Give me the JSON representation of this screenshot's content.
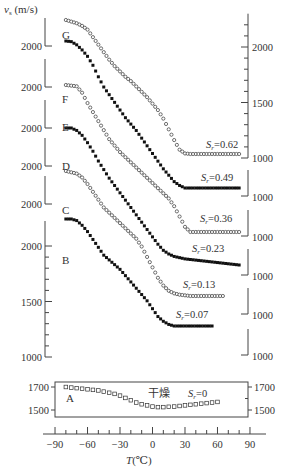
{
  "chart_data": {
    "type": "scatter",
    "title": "",
    "xlabel": "T (℃)",
    "ylabel": "v_s (m/s)",
    "x_ticks": [
      -90,
      -60,
      -30,
      0,
      30,
      60,
      90
    ],
    "xlim": [
      -90,
      90
    ],
    "dry_label": "干燥",
    "series": [
      {
        "name": "G",
        "sr": "Sr=0.62",
        "marker": "open-circle",
        "offset_2000_y": 45,
        "x": [
          -80,
          -75,
          -70,
          -65,
          -60,
          -55,
          -50,
          -45,
          -40,
          -35,
          -30,
          -25,
          -20,
          -15,
          -10,
          -5,
          0,
          5,
          10,
          15,
          20,
          25,
          30,
          35,
          40,
          45,
          50,
          55,
          60,
          65,
          70,
          75,
          80
        ],
        "y": [
          2280,
          2265,
          2250,
          2225,
          2190,
          2120,
          2050,
          1980,
          1910,
          1850,
          1800,
          1750,
          1710,
          1660,
          1610,
          1560,
          1500,
          1440,
          1360,
          1260,
          1160,
          1070,
          1035,
          1030,
          1030,
          1030,
          1030,
          1030,
          1030,
          1030,
          1030,
          1030,
          1030
        ]
      },
      {
        "name": "F",
        "sr": "Sr=0.49",
        "marker": "filled-square",
        "offset_2000_y": 118,
        "x": [
          -80,
          -75,
          -70,
          -65,
          -60,
          -55,
          -50,
          -45,
          -40,
          -35,
          -30,
          -25,
          -20,
          -15,
          -10,
          -5,
          0,
          5,
          10,
          15,
          20,
          25,
          30,
          35,
          40,
          45,
          50,
          55,
          60,
          65,
          70,
          75,
          80
        ],
        "y": [
          2180,
          2175,
          2150,
          2110,
          2060,
          1990,
          1900,
          1820,
          1760,
          1700,
          1640,
          1580,
          1530,
          1480,
          1420,
          1360,
          1300,
          1240,
          1180,
          1130,
          1080,
          1050,
          1030,
          1030,
          1030,
          1030,
          1030,
          1030,
          1030,
          1030,
          1030,
          1030,
          1030
        ]
      },
      {
        "name": "E",
        "sr": "Sr=0.36",
        "marker": "open-circle",
        "offset_2000_y": 185,
        "x": [
          -80,
          -75,
          -70,
          -65,
          -60,
          -55,
          -50,
          -45,
          -40,
          -35,
          -30,
          -25,
          -20,
          -15,
          -10,
          -5,
          0,
          5,
          10,
          15,
          20,
          25,
          30,
          35,
          40,
          45,
          50,
          55,
          60,
          65,
          70,
          75,
          80
        ],
        "y": [
          2160,
          2155,
          2150,
          2100,
          2020,
          1950,
          1880,
          1810,
          1740,
          1690,
          1640,
          1600,
          1560,
          1520,
          1480,
          1440,
          1400,
          1360,
          1320,
          1280,
          1220,
          1140,
          1060,
          1020,
          1020,
          1020,
          1020,
          1020,
          1020,
          1020,
          1020,
          1020,
          1020
        ]
      },
      {
        "name": "D",
        "sr": "Sr=0.23",
        "marker": "filled-square",
        "offset_2000_y": 250,
        "x": [
          -80,
          -75,
          -70,
          -65,
          -60,
          -55,
          -50,
          -45,
          -40,
          -35,
          -30,
          -25,
          -20,
          -15,
          -10,
          -5,
          0,
          5,
          10,
          15,
          20,
          25,
          30,
          35,
          40,
          45,
          50,
          55,
          60,
          65,
          70,
          75,
          80
        ],
        "y": [
          2170,
          2170,
          2150,
          2110,
          2050,
          1980,
          1900,
          1830,
          1760,
          1700,
          1640,
          1580,
          1520,
          1460,
          1400,
          1340,
          1280,
          1220,
          1170,
          1140,
          1120,
          1110,
          1100,
          1095,
          1090,
          1085,
          1080,
          1075,
          1070,
          1065,
          1060,
          1055,
          1050
        ]
      },
      {
        "name": "C",
        "sr": "Sr=0.13",
        "marker": "open-circle",
        "offset_2000_y": 210,
        "x": [
          -80,
          -75,
          -70,
          -65,
          -60,
          -55,
          -50,
          -45,
          -40,
          -35,
          -30,
          -25,
          -20,
          -15,
          -10,
          -5,
          0,
          5,
          10,
          15,
          20,
          25,
          30,
          35,
          40,
          45,
          50,
          55,
          60,
          65
        ],
        "y": [
          2080,
          2070,
          2060,
          2030,
          1980,
          1920,
          1860,
          1800,
          1760,
          1720,
          1680,
          1640,
          1600,
          1560,
          1500,
          1420,
          1340,
          1260,
          1200,
          1160,
          1140,
          1130,
          1125,
          1120,
          1120,
          1120,
          1120,
          1120,
          1120,
          1120
        ]
      },
      {
        "name": "B",
        "sr": "Sr=0.07",
        "marker": "filled-square",
        "offset_2000_y": 246,
        "x": [
          -80,
          -75,
          -70,
          -65,
          -60,
          -55,
          -50,
          -45,
          -40,
          -35,
          -30,
          -25,
          -20,
          -15,
          -10,
          -5,
          0,
          5,
          10,
          15,
          20,
          25,
          30,
          35,
          40,
          45,
          50,
          55
        ],
        "y": [
          1980,
          1980,
          1970,
          1940,
          1900,
          1850,
          1800,
          1750,
          1720,
          1690,
          1660,
          1620,
          1580,
          1540,
          1500,
          1460,
          1410,
          1360,
          1330,
          1310,
          1300,
          1300,
          1300,
          1300,
          1300,
          1300,
          1300,
          1300
        ]
      },
      {
        "name": "A",
        "sr": "Sr=0",
        "marker": "open-square",
        "panel": "dry",
        "x": [
          -80,
          -75,
          -70,
          -65,
          -60,
          -55,
          -50,
          -45,
          -40,
          -35,
          -30,
          -25,
          -20,
          -15,
          -10,
          -5,
          0,
          5,
          10,
          15,
          20,
          25,
          30,
          35,
          40,
          45,
          50,
          55,
          60
        ],
        "y": [
          1700,
          1695,
          1690,
          1685,
          1680,
          1675,
          1670,
          1660,
          1650,
          1640,
          1625,
          1605,
          1585,
          1565,
          1550,
          1540,
          1530,
          1525,
          1525,
          1528,
          1530,
          1535,
          1540,
          1545,
          1550,
          1555,
          1560,
          1565,
          1570
        ]
      }
    ],
    "left_axis_labels": [
      {
        "curve": "G",
        "value": "2000"
      },
      {
        "curve": "F",
        "value": "2000"
      },
      {
        "curve": "E",
        "value": "2000"
      },
      {
        "curve": "D",
        "value": "2000"
      },
      {
        "curve": "C",
        "value": "2000"
      },
      {
        "curve": "B",
        "values": [
          "2000",
          "1500",
          "1000"
        ]
      },
      {
        "curve": "A",
        "values": [
          "1700",
          "1500"
        ]
      }
    ],
    "right_axis_labels": [
      {
        "curve": "G",
        "values": [
          "2000",
          "1500",
          "1000"
        ]
      },
      {
        "curve": "F",
        "value": "1000"
      },
      {
        "curve": "E",
        "value": "1000"
      },
      {
        "curve": "D",
        "value": "1000"
      },
      {
        "curve": "C",
        "value": "1000"
      },
      {
        "curve": "B",
        "value": "1000"
      },
      {
        "curve": "A",
        "values": [
          "1700",
          "1500"
        ]
      }
    ],
    "grid": false,
    "legend": "inline labels"
  },
  "labels": {
    "y_axis_title": "v",
    "y_axis_sub": "s",
    "y_axis_unit": " (m/s)",
    "x_axis_title": "T",
    "x_axis_unit": "(℃)",
    "dry": "干燥"
  }
}
